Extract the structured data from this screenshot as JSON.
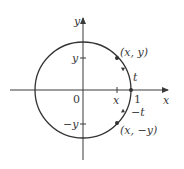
{
  "diagram": {
    "axes": {
      "x_label": "x",
      "y_label": "y",
      "origin_label": "0"
    },
    "ticks": {
      "x_tick_label": "x",
      "one_label": "1",
      "y_tick_label": "y",
      "neg_y_tick_label": "−y"
    },
    "points": {
      "upper": "(x, y)",
      "lower": "(x, −y)"
    },
    "arcs": {
      "upper_arc_label": "t",
      "lower_arc_label": "−t"
    },
    "colors": {
      "stroke": "#3a3a3a",
      "circle": "#333333",
      "background": "#ffffff"
    }
  }
}
